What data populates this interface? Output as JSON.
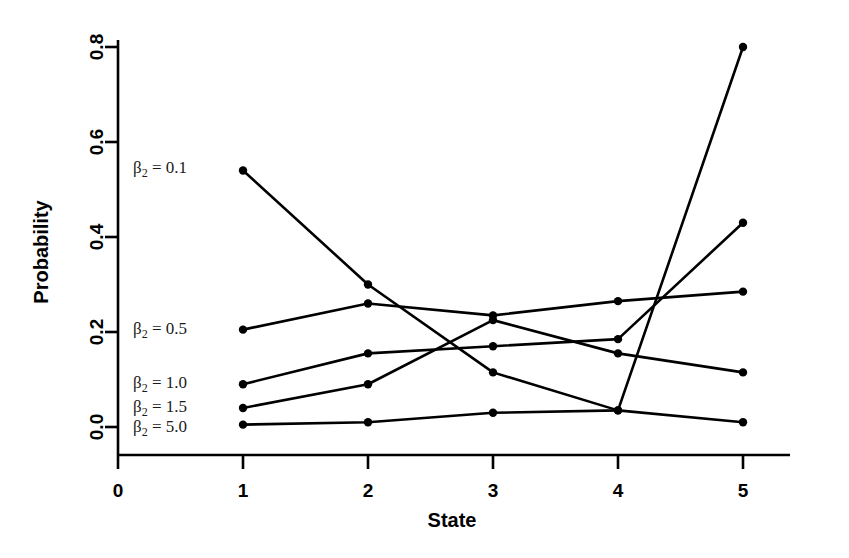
{
  "chart_data": {
    "type": "line",
    "title": "",
    "xlabel": "State",
    "ylabel": "Probability",
    "x": [
      1,
      2,
      3,
      4,
      5
    ],
    "xlim": [
      0,
      5.55
    ],
    "ylim": [
      0.0,
      0.84
    ],
    "xticks": [
      "0",
      "1",
      "2",
      "3",
      "4",
      "5"
    ],
    "xtick_values": [
      0,
      1,
      2,
      3,
      4,
      5
    ],
    "yticks": [
      "0.0",
      "0.2",
      "0.4",
      "0.6",
      "0.8"
    ],
    "ytick_values": [
      0.0,
      0.2,
      0.4,
      0.6,
      0.8
    ],
    "grid": false,
    "legend_position": "inline-left",
    "marker": "filled-circle",
    "line_color": "#000000",
    "series": [
      {
        "name": "β₂ = 0.1",
        "param": "0.1",
        "values": [
          0.54,
          0.3,
          0.115,
          0.035,
          0.01
        ],
        "label_x": 0.12,
        "label_y": 0.545
      },
      {
        "name": "β₂ = 0.5",
        "param": "0.5",
        "values": [
          0.205,
          0.26,
          0.235,
          0.265,
          0.285
        ],
        "label_x": 0.12,
        "label_y": 0.207
      },
      {
        "name": "β₂ = 1.0",
        "param": "1.0",
        "values": [
          0.09,
          0.155,
          0.17,
          0.185,
          0.43
        ],
        "label_x": 0.12,
        "label_y": 0.092
      },
      {
        "name": "β₂ = 1.5",
        "param": "1.5",
        "values": [
          0.04,
          0.09,
          0.225,
          0.155,
          0.115
        ],
        "label_x": 0.12,
        "label_y": 0.043
      },
      {
        "name": "β₂ = 5.0",
        "param": "5.0",
        "values": [
          0.005,
          0.01,
          0.03,
          0.035,
          0.8
        ],
        "label_x": 0.12,
        "label_y": 0.0
      }
    ]
  },
  "labels": {
    "x_axis_title": "State",
    "y_axis_title": "Probability",
    "beta_symbol": "β",
    "beta_subscript": "2",
    "equals": "="
  }
}
